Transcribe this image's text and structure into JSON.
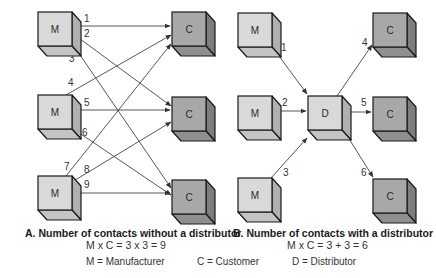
{
  "colors": {
    "manufacturer_front": "#d9d9d9",
    "manufacturer_top": "#c4c4c4",
    "manufacturer_side": "#b0b0b0",
    "customer_front": "#a8a8a8",
    "customer_top": "#8f8f8f",
    "customer_side": "#7d7d7d",
    "distributor_front": "#d9d9d9",
    "distributor_top": "#c4c4c4",
    "distributor_side": "#b0b0b0",
    "stroke": "#1a1a1a",
    "edge": "#444444"
  },
  "panel_a": {
    "title": "A. Number of contacts without a distributor",
    "formula": "M x C = 3 x 3 = 9",
    "nodes": [
      {
        "id": "a-m1",
        "type": "M",
        "label": "M",
        "x": 38,
        "y": 12
      },
      {
        "id": "a-m2",
        "type": "M",
        "label": "M",
        "x": 38,
        "y": 95
      },
      {
        "id": "a-m3",
        "type": "M",
        "label": "M",
        "x": 38,
        "y": 176
      },
      {
        "id": "a-c1",
        "type": "C",
        "label": "C",
        "x": 172,
        "y": 12
      },
      {
        "id": "a-c2",
        "type": "C",
        "label": "C",
        "x": 172,
        "y": 97
      },
      {
        "id": "a-c3",
        "type": "C",
        "label": "C",
        "x": 172,
        "y": 180
      }
    ],
    "edges": [
      {
        "label": "1",
        "x1": 72,
        "y1": 26,
        "x2": 170,
        "y2": 26,
        "lx": 84,
        "ly": 22
      },
      {
        "label": "2",
        "x1": 72,
        "y1": 33,
        "x2": 171,
        "y2": 106,
        "lx": 84,
        "ly": 37
      },
      {
        "label": "3",
        "x1": 78,
        "y1": 52,
        "x2": 171,
        "y2": 188,
        "lx": 69,
        "ly": 62
      },
      {
        "label": "4",
        "x1": 66,
        "y1": 95,
        "x2": 171,
        "y2": 35,
        "lx": 68,
        "ly": 86
      },
      {
        "label": "5",
        "x1": 72,
        "y1": 110,
        "x2": 170,
        "y2": 110,
        "lx": 84,
        "ly": 106
      },
      {
        "label": "6",
        "x1": 72,
        "y1": 128,
        "x2": 171,
        "y2": 195,
        "lx": 82,
        "ly": 136
      },
      {
        "label": "7",
        "x1": 66,
        "y1": 176,
        "x2": 171,
        "y2": 44,
        "lx": 64,
        "ly": 170
      },
      {
        "label": "8",
        "x1": 72,
        "y1": 182,
        "x2": 171,
        "y2": 122,
        "lx": 84,
        "ly": 173
      },
      {
        "label": "9",
        "x1": 72,
        "y1": 193,
        "x2": 170,
        "y2": 193,
        "lx": 84,
        "ly": 188
      }
    ]
  },
  "panel_b": {
    "title": "B. Number of contacts with a distributor",
    "formula": "M x C = 3 + 3 = 6",
    "nodes": [
      {
        "id": "b-m1",
        "type": "M",
        "label": "M",
        "x": 238,
        "y": 13
      },
      {
        "id": "b-m2",
        "type": "M",
        "label": "M",
        "x": 238,
        "y": 96
      },
      {
        "id": "b-m3",
        "type": "M",
        "label": "M",
        "x": 238,
        "y": 178
      },
      {
        "id": "b-d",
        "type": "D",
        "label": "D",
        "x": 308,
        "y": 96
      },
      {
        "id": "b-c1",
        "type": "C",
        "label": "C",
        "x": 373,
        "y": 13
      },
      {
        "id": "b-c2",
        "type": "C",
        "label": "C",
        "x": 373,
        "y": 97
      },
      {
        "id": "b-c3",
        "type": "C",
        "label": "C",
        "x": 373,
        "y": 179
      }
    ],
    "edges": [
      {
        "label": "1",
        "x1": 276,
        "y1": 52,
        "x2": 307,
        "y2": 94,
        "lx": 281,
        "ly": 51
      },
      {
        "label": "2",
        "x1": 273,
        "y1": 111,
        "x2": 306,
        "y2": 111,
        "lx": 282,
        "ly": 106
      },
      {
        "label": "3",
        "x1": 271,
        "y1": 178,
        "x2": 307,
        "y2": 138,
        "lx": 283,
        "ly": 176
      },
      {
        "label": "4",
        "x1": 337,
        "y1": 96,
        "x2": 372,
        "y2": 45,
        "lx": 362,
        "ly": 46
      },
      {
        "label": "5",
        "x1": 345,
        "y1": 112,
        "x2": 371,
        "y2": 112,
        "lx": 361,
        "ly": 106
      },
      {
        "label": "6",
        "x1": 346,
        "y1": 134,
        "x2": 373,
        "y2": 177,
        "lx": 361,
        "ly": 176
      }
    ]
  },
  "legend": [
    {
      "key": "manufacturer",
      "text": "M = Manufacturer"
    },
    {
      "key": "customer",
      "text": "C = Customer"
    },
    {
      "key": "distributor",
      "text": "D = Distributor"
    }
  ]
}
